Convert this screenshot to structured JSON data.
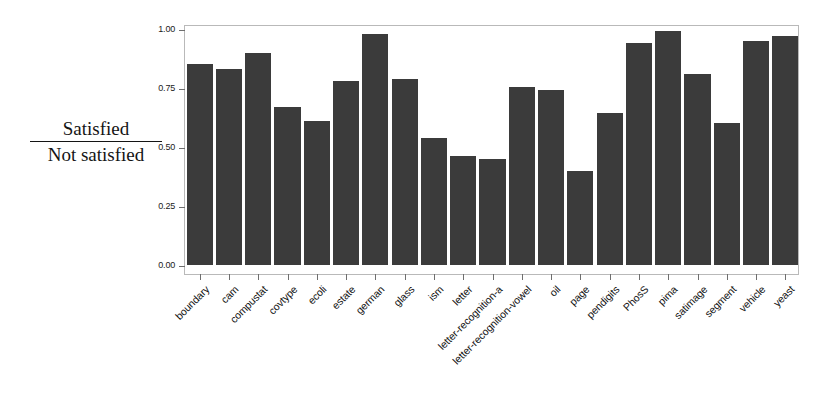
{
  "chart_data": {
    "type": "bar",
    "title": "",
    "subtitle": "",
    "xlabel": "",
    "ylabel": "Satisfied / Not satisfied",
    "ylabel_numerator": "Satisfied",
    "ylabel_denominator": "Not satisfied",
    "ylim": [
      0.0,
      1.0
    ],
    "ytick_labels": [
      "0.00",
      "0.25",
      "0.50",
      "0.75",
      "1.00"
    ],
    "ytick_values": [
      0.0,
      0.25,
      0.5,
      0.75,
      1.0
    ],
    "grid": false,
    "legend": "none",
    "bar_color": "#3b3b3b",
    "frame_color": "#b9b9b9",
    "background": "#ffffff",
    "categories": [
      "boundary",
      "cam",
      "compustat",
      "covtype",
      "ecoli",
      "estate",
      "german",
      "glass",
      "ism",
      "letter",
      "letter-recognition-a",
      "letter-recognition-vowel",
      "oil",
      "page",
      "pendigits",
      "PhosS",
      "pima",
      "satimage",
      "segment",
      "vehicle",
      "yeast"
    ],
    "values": [
      0.85,
      0.83,
      0.9,
      0.67,
      0.61,
      0.78,
      0.98,
      0.79,
      0.54,
      0.46,
      0.45,
      0.755,
      0.74,
      0.4,
      0.645,
      0.94,
      0.99,
      0.81,
      0.6,
      0.95,
      0.97
    ]
  }
}
